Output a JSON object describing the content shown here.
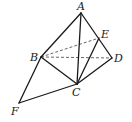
{
  "diagram": {
    "type": "geometry-figure",
    "points": {
      "A": {
        "x": 81,
        "y": 13,
        "lx": 77,
        "ly": 10
      },
      "E": {
        "x": 99,
        "y": 38,
        "lx": 101,
        "ly": 38
      },
      "D": {
        "x": 112,
        "y": 58,
        "lx": 114,
        "ly": 62
      },
      "B": {
        "x": 41,
        "y": 57,
        "lx": 30,
        "ly": 61
      },
      "C": {
        "x": 77,
        "y": 84,
        "lx": 72,
        "ly": 96
      },
      "F": {
        "x": 19,
        "y": 103,
        "lx": 11,
        "ly": 115
      }
    },
    "labels": {
      "A": "A",
      "B": "B",
      "C": "C",
      "D": "D",
      "E": "E",
      "F": "F"
    },
    "solid_edges": [
      [
        "A",
        "B"
      ],
      [
        "A",
        "C"
      ],
      [
        "A",
        "D"
      ],
      [
        "B",
        "C"
      ],
      [
        "B",
        "F"
      ],
      [
        "F",
        "C"
      ],
      [
        "C",
        "E"
      ],
      [
        "C",
        "D"
      ]
    ],
    "dashed_edges": [
      [
        "B",
        "E"
      ],
      [
        "B",
        "D"
      ]
    ],
    "colors": {
      "line": "#1a1a1a",
      "dashed": "#555555",
      "background": "#ffffff"
    }
  }
}
